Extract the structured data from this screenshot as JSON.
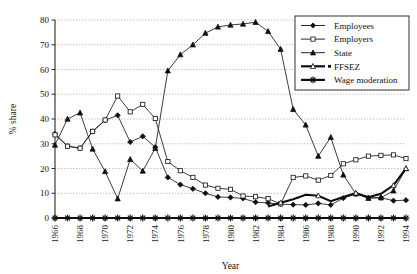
{
  "chart_data": {
    "type": "line",
    "title": "",
    "xlabel": "Year",
    "ylabel": "% share",
    "xlim": [
      1966,
      1994
    ],
    "ylim": [
      0,
      80
    ],
    "ytick_step": 10,
    "xtick_label_step": 2,
    "grid": true,
    "legend_position": "top-right",
    "x": [
      1966,
      1967,
      1968,
      1969,
      1970,
      1971,
      1972,
      1973,
      1974,
      1975,
      1976,
      1977,
      1978,
      1979,
      1980,
      1981,
      1982,
      1983,
      1984,
      1985,
      1986,
      1987,
      1988,
      1989,
      1990,
      1991,
      1992,
      1993,
      1994
    ],
    "ticklabels_x": [
      "1966",
      "1968",
      "1970",
      "1972",
      "1974",
      "1976",
      "1978",
      "1980",
      "1982",
      "1984",
      "1986",
      "1988",
      "1990",
      "1992",
      "1994"
    ],
    "ticklabels_y": [
      "0",
      "10",
      "20",
      "30",
      "40",
      "50",
      "60",
      "70",
      "80"
    ],
    "series": [
      {
        "name": "Employees",
        "marker": "filled-diamond",
        "values": [
          34.0,
          29.1,
          28.2,
          35.0,
          39.5,
          41.5,
          30.7,
          33.0,
          28.6,
          16.4,
          13.5,
          11.8,
          10.0,
          8.5,
          8.3,
          7.9,
          6.4,
          6.1,
          5.6,
          5.4,
          5.3,
          5.9,
          5.3,
          8.0,
          9.7,
          8.2,
          8.2,
          7.0,
          7.2
        ]
      },
      {
        "name": "Employers",
        "marker": "open-square",
        "values": [
          33.6,
          29.0,
          28.2,
          35.0,
          39.6,
          49.3,
          42.9,
          45.9,
          40.2,
          22.8,
          19.1,
          16.4,
          13.3,
          12.0,
          11.6,
          8.9,
          8.6,
          7.8,
          5.7,
          16.4,
          17.0,
          15.3,
          17.2,
          21.9,
          23.5,
          25.0,
          25.3,
          25.5,
          24.0
        ]
      },
      {
        "name": "State",
        "marker": "filled-triangle",
        "values": [
          29.5,
          40.0,
          42.5,
          27.9,
          18.8,
          7.8,
          23.7,
          19.0,
          28.2,
          59.5,
          66.0,
          70.0,
          74.7,
          77.2,
          78.0,
          78.4,
          79.1,
          75.4,
          68.2,
          43.9,
          37.6,
          25.0,
          32.6,
          17.4,
          9.8,
          8.0,
          8.2,
          11.0,
          20.0
        ]
      },
      {
        "name": "FFSEZ",
        "marker": "open-triangle",
        "line": "thick",
        "start_year": 1983,
        "values": [
          null,
          null,
          null,
          null,
          null,
          null,
          null,
          null,
          null,
          null,
          null,
          null,
          null,
          null,
          null,
          null,
          null,
          4.6,
          6.2,
          7.6,
          9.4,
          9.0,
          6.8,
          8.5,
          10.1,
          8.4,
          9.8,
          13.2,
          20.0
        ]
      },
      {
        "name": "Wage moderation",
        "marker": "asterisk",
        "line": "thick",
        "values": [
          0,
          0,
          0,
          0,
          0,
          0,
          0,
          0,
          0,
          0,
          0,
          0,
          0,
          0,
          0,
          0,
          0,
          0,
          0,
          0,
          0,
          0,
          0,
          0,
          0,
          0,
          0,
          0,
          0
        ]
      }
    ]
  },
  "legend": {
    "items": [
      {
        "label": "Employees",
        "marker": "filled-diamond"
      },
      {
        "label": "Employers",
        "marker": "open-square"
      },
      {
        "label": "State",
        "marker": "filled-triangle"
      },
      {
        "label": "FFSEZ",
        "marker": "open-triangle-thick"
      },
      {
        "label": "Wage moderation",
        "marker": "asterisk-thick"
      }
    ]
  },
  "axes": {
    "x_title": "Year",
    "y_title": "% share"
  },
  "colors": {
    "ink": "#101010",
    "grid": "#9a9a9a",
    "background": "#ffffff"
  }
}
